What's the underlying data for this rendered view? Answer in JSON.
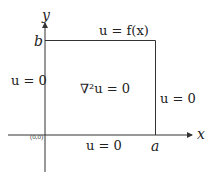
{
  "diagram": {
    "axes": {
      "x_label": "x",
      "y_label": "y",
      "origin": "(0,0)"
    },
    "corners": {
      "x_end": "a",
      "y_end": "b"
    },
    "boundary_conditions": {
      "top": "u = f(x)",
      "left": "u = 0",
      "right": "u = 0",
      "bottom": "u = 0"
    },
    "interior_equation": "∇²u = 0",
    "colors": {
      "line": "#333333",
      "background": "#ffffff"
    }
  }
}
